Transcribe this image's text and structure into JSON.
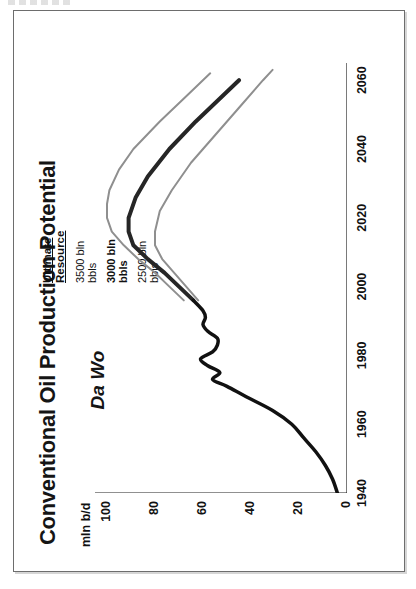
{
  "figure": {
    "title": "Conventional Oil Production Potential",
    "subtitle": "Da Wo"
  },
  "legend": {
    "heading_line1": "Ultimate",
    "heading_line2": "Resource",
    "entries": [
      {
        "line1": "3500 bln",
        "line2": "bbls",
        "color": "#8f8f8f",
        "bold": false
      },
      {
        "line1": "3000 bln",
        "line2": "bbls",
        "color": "#262626",
        "bold": true
      },
      {
        "line1": "2500 bln",
        "line2": "bbls",
        "color": "#8f8f8f",
        "bold": false
      }
    ]
  },
  "chart_data": {
    "type": "line",
    "title": "Conventional Oil Production Potential",
    "subtitle": "Da Wo",
    "xlabel": "",
    "ylabel": "mln b/d",
    "xlim": [
      1940,
      2065
    ],
    "ylim": [
      0,
      105
    ],
    "xticks": [
      1940,
      1960,
      1980,
      2000,
      2020,
      2040,
      2060
    ],
    "xticklabels": [
      "1940",
      "1960",
      "1980",
      "2000",
      "2020",
      "2040",
      "2060"
    ],
    "yticks": [
      0,
      20,
      40,
      60,
      80,
      100
    ],
    "yticklabels": [
      "0",
      "20",
      "40",
      "60",
      "80",
      "100"
    ],
    "grid": false,
    "legend_position": "upper-right",
    "legend_title": "Ultimate Resource",
    "orientation": "rotated-90-ccw",
    "series": [
      {
        "name": "3500 bln bbls",
        "color": "#8f8f8f",
        "linewidth": 2,
        "x": [
          1996,
          2000,
          2004,
          2008,
          2012,
          2016,
          2020,
          2024,
          2028,
          2034,
          2040,
          2048,
          2056,
          2062
        ],
        "values": [
          68,
          74,
          80,
          87,
          93,
          98,
          100,
          100,
          99,
          95,
          89,
          78,
          66,
          57
        ]
      },
      {
        "name": "3000 bln bbls",
        "color": "#262626",
        "linewidth": 4,
        "x": [
          1996,
          2000,
          2004,
          2008,
          2012,
          2016,
          2020,
          2026,
          2032,
          2040,
          2048,
          2056,
          2060
        ],
        "values": [
          64,
          70,
          76,
          83,
          89,
          91,
          91,
          88,
          83,
          74,
          63,
          51,
          45
        ]
      },
      {
        "name": "2500 bln bbls",
        "color": "#8f8f8f",
        "linewidth": 2,
        "x": [
          1996,
          2000,
          2004,
          2008,
          2012,
          2016,
          2022,
          2028,
          2036,
          2044,
          2052,
          2060,
          2063
        ],
        "values": [
          62,
          67,
          72,
          77,
          80,
          80,
          78,
          73,
          65,
          55,
          45,
          35,
          31
        ]
      },
      {
        "name": "Historical production",
        "color": "#111111",
        "linewidth": 3.5,
        "x": [
          1940,
          1944,
          1948,
          1952,
          1956,
          1960,
          1964,
          1968,
          1971,
          1973,
          1975,
          1977,
          1979,
          1981,
          1983,
          1985,
          1987,
          1989,
          1991,
          1993,
          1996
        ],
        "values": [
          4,
          6,
          9,
          13,
          18,
          23,
          31,
          42,
          50,
          56,
          53,
          58,
          61,
          56,
          54,
          54,
          58,
          60,
          59,
          60,
          64
        ]
      }
    ]
  }
}
